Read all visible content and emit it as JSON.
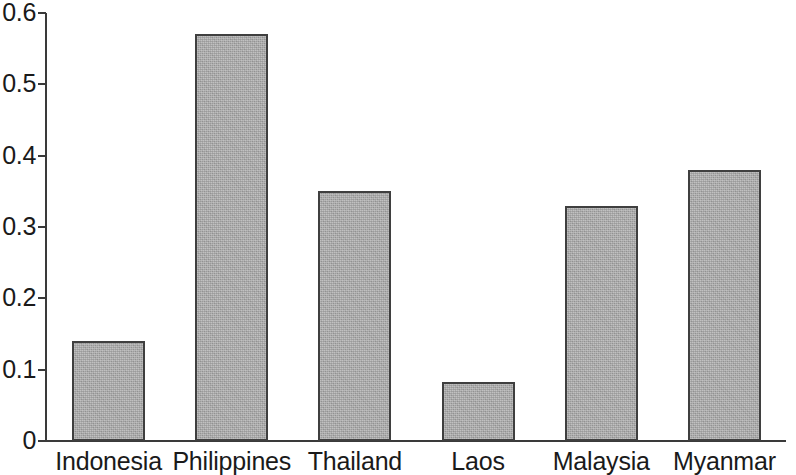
{
  "chart_data": {
    "type": "bar",
    "title": "",
    "subtitle": "",
    "xlabel": "",
    "ylabel": "",
    "categories": [
      "Indonesia",
      "Philippines",
      "Thailand",
      "Laos",
      "Malaysia",
      "Myanmar"
    ],
    "values": [
      0.14,
      0.57,
      0.35,
      0.083,
      0.33,
      0.38
    ],
    "ylim": [
      0,
      0.6
    ],
    "ytick_labels": [
      "0.6",
      "0.5",
      "0.4",
      "0.3",
      "0.2",
      "0.1",
      "0"
    ],
    "ytick_values": [
      0.6,
      0.5,
      0.4,
      0.3,
      0.2,
      0.1,
      0
    ],
    "ytick_step": 0.1,
    "grid": false,
    "legend": null,
    "legend_position": "none",
    "annotations": [],
    "bar_fill_color": "#a9a9a9",
    "bar_border_color": "#3f3f3f",
    "axis_color": "#3a3a3a",
    "background_color": "#ffffff"
  }
}
